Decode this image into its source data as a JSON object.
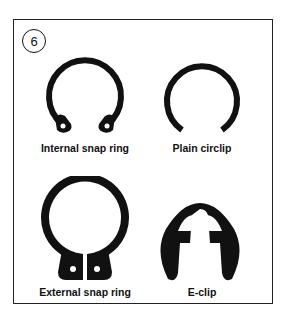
{
  "figure": {
    "number": "6",
    "items": [
      {
        "label": "Internal snap ring",
        "icon": "internal-snap-ring-icon"
      },
      {
        "label": "Plain circlip",
        "icon": "plain-circlip-icon"
      },
      {
        "label": "External snap ring",
        "icon": "external-snap-ring-icon"
      },
      {
        "label": "E-clip",
        "icon": "e-clip-icon"
      }
    ]
  }
}
